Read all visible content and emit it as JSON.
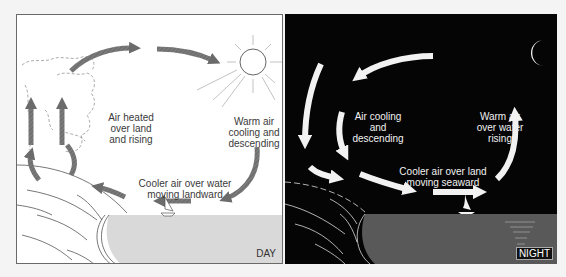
{
  "day": {
    "tag": "DAY",
    "labels": {
      "rising": "Air heated\nover land\nand rising",
      "descending": "Warm air\ncooling and\ndescending",
      "surface": "Cooler air over water\nmoving landward"
    },
    "icons": [
      "sun-icon",
      "sailboat-icon",
      "cloud-icon"
    ],
    "colors": {
      "background": "#ffffff",
      "arrow": "#6b6b6b",
      "water": "#d8d8d8",
      "line": "#555555"
    }
  },
  "night": {
    "tag": "NIGHT",
    "labels": {
      "descending": "Air cooling\nand\ndescending",
      "rising": "Warm air\nover water\nrising",
      "surface": "Cooler air over land\nmoving seaward"
    },
    "icons": [
      "moon-icon",
      "sailboat-icon"
    ],
    "colors": {
      "background": "#050505",
      "arrow": "#f2f2f2",
      "water": "#5a5a5a",
      "line": "#e0e0e0"
    }
  }
}
